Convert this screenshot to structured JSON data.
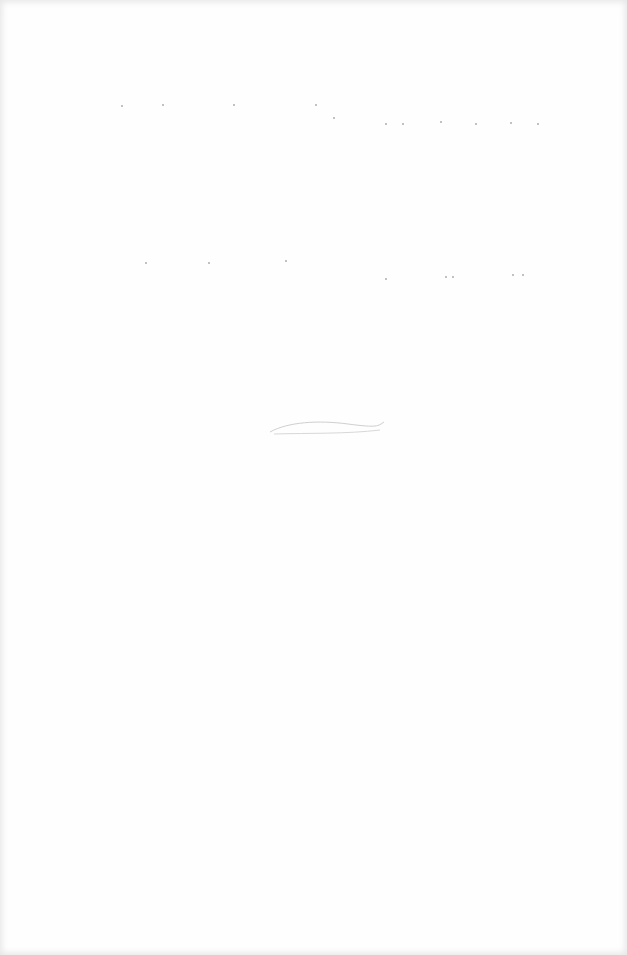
{
  "page": {
    "type": "blank-scanned-page",
    "background": "#fefefe",
    "mark_color": "#8a8a8a",
    "text": ""
  },
  "marks": {
    "row1": [
      [
        121,
        105
      ],
      [
        162,
        104
      ],
      [
        233,
        104
      ],
      [
        315,
        104
      ],
      [
        333,
        117
      ],
      [
        385,
        123
      ],
      [
        402,
        123
      ],
      [
        440,
        121
      ],
      [
        475,
        123
      ],
      [
        510,
        122
      ],
      [
        537,
        123
      ]
    ],
    "row2": [
      [
        145,
        262
      ],
      [
        208,
        262
      ],
      [
        285,
        260
      ],
      [
        385,
        278
      ],
      [
        445,
        276
      ],
      [
        452,
        276
      ],
      [
        512,
        274
      ],
      [
        522,
        274
      ]
    ]
  }
}
